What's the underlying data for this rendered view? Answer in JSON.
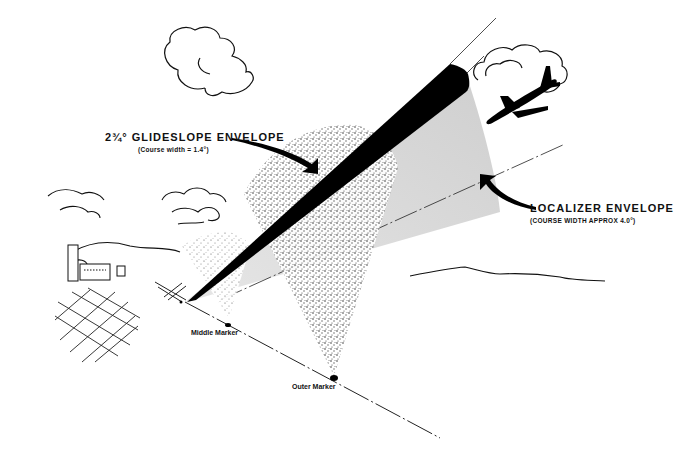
{
  "figure": {
    "labels": {
      "glideslope": {
        "title": "2¾° GLIDESLOPE ENVELOPE",
        "subtitle": "(Course width = 1.4°)"
      },
      "localizer": {
        "title": "LOCALIZER ENVELOPE",
        "subtitle": "(COURSE WIDTH APPROX 4.0°)"
      },
      "middle_marker": "Middle Marker",
      "outer_marker": "Outer Marker"
    },
    "colors": {
      "ink": "#111111",
      "glideslope_beam": "#000000",
      "localizer_beam": "#d9d9d9",
      "marker_cone": "#9a9a9a",
      "background": "#ffffff"
    },
    "elements": [
      "clouds",
      "aircraft",
      "airport buildings",
      "runway grid",
      "runway",
      "glideslope beam",
      "localizer beam",
      "middle marker cone",
      "outer marker cone",
      "course line"
    ]
  }
}
